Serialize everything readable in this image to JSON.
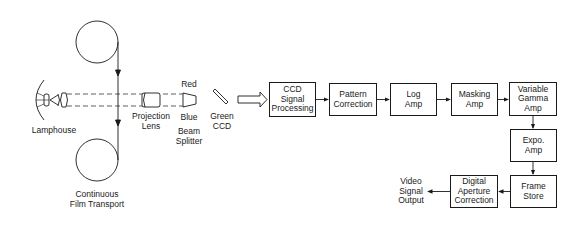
{
  "diagram": {
    "optics": {
      "lamphouse": "Lamphouse",
      "film_transport": "Continuous\nFilm Transport",
      "projection_lens": "Projection\nLens",
      "red": "Red",
      "blue": "Blue",
      "beam_splitter": "Beam\nSplitter",
      "green_ccd": "Green\nCCD"
    },
    "blocks": {
      "ccd_signal_processing": "CCD\nSignal\nProcessing",
      "pattern_correction": "Pattern\nCorrection",
      "log_amp": "Log\nAmp",
      "masking_amp": "Masking\nAmp",
      "variable_gamma_amp": "Variable\nGamma\nAmp",
      "expo_amp": "Expo.\nAmp",
      "frame_store": "Frame\nStore",
      "digital_aperture_correction": "Digital\nAperture\nCorrection"
    },
    "output": "Video\nSignal\nOutput",
    "colors": {
      "line": "#1a1a1a",
      "background": "#ffffff"
    }
  }
}
